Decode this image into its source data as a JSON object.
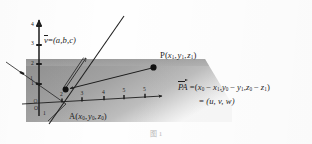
{
  "figure": {
    "type": "geometry-diagram-3d",
    "caption": "图 1",
    "axes": {
      "z_axis": {
        "label": "",
        "orientation": "vertical-up",
        "tick_labels": [
          "1",
          "2",
          "3",
          "4"
        ]
      },
      "x_axis": {
        "label": "",
        "orientation": "horizontal-right",
        "tick_labels": [
          "2",
          "3",
          "4",
          "5"
        ]
      },
      "y_axis": {
        "label": "",
        "orientation": "diagonal-lower-left",
        "tick_labels": [
          "1",
          "2"
        ]
      },
      "origin_label": "O"
    },
    "points": [
      {
        "name": "P",
        "label": "P(x1, y1, z1)",
        "label_parts": {
          "head": "P(",
          "x": "x",
          "xs": "1",
          "y": "y",
          "ys": "1",
          "z": "z",
          "zs": "1",
          "tail": ")"
        },
        "marker": "filled-dot"
      },
      {
        "name": "A",
        "label": "A(x0, y0, z0)",
        "label_parts": {
          "head": "A(",
          "x": "x",
          "xs": "0",
          "y": "y",
          "ys": "0",
          "z": "z",
          "zs": "0",
          "tail": ")"
        },
        "marker": "filled-dot"
      }
    ],
    "vectors": [
      {
        "name": "v",
        "symbol": "v",
        "accent": "overbar",
        "equals": "=",
        "components_text": "(a,b,c)",
        "components": [
          "a",
          "b",
          "c"
        ]
      },
      {
        "name": "PA",
        "symbol": "PA",
        "accent": "overarrow",
        "equals": "=",
        "components_text": "(x0 - x1, y0 - y1, z0 - z1)",
        "second_line_equals": "=",
        "second_line_text": "(u, v, w)",
        "second_line_components": [
          "u",
          "v",
          "w"
        ],
        "minus": "−",
        "comma": ","
      }
    ],
    "colors": {
      "ink": "#1d1d1d",
      "plane_fill": "#9b9b9b",
      "plane_fill_light": "#b5b5b5",
      "paper": "#fefefe",
      "caption": "#b9b9b9"
    }
  }
}
